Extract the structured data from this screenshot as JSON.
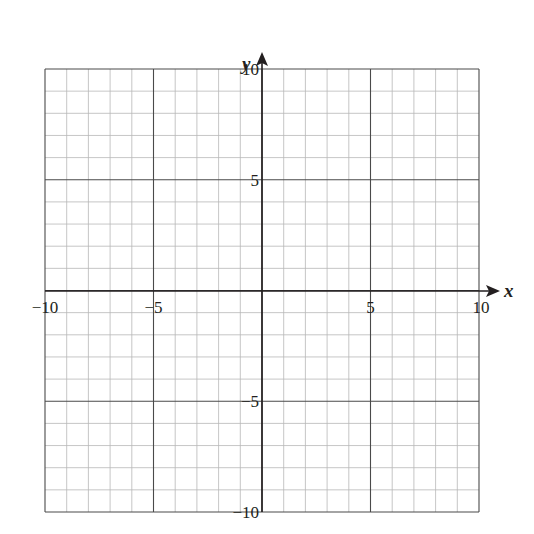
{
  "chart_data": {
    "type": "scatter",
    "title": "",
    "xlabel": "x",
    "ylabel": "y",
    "xlim": [
      -10,
      10
    ],
    "ylim": [
      -10,
      10
    ],
    "grid": true,
    "minor_grid_step": 1,
    "major_grid_step": 5,
    "x_ticks": [
      {
        "value": -10,
        "label": "−10"
      },
      {
        "value": -5,
        "label": "−5"
      },
      {
        "value": 5,
        "label": "5"
      },
      {
        "value": 10,
        "label": "10"
      }
    ],
    "y_ticks": [
      {
        "value": 10,
        "label": "10"
      },
      {
        "value": 5,
        "label": "5"
      },
      {
        "value": -5,
        "label": "−5"
      },
      {
        "value": -10,
        "label": "−10"
      }
    ],
    "series": [],
    "colors": {
      "axis": "#231f20",
      "major_grid": "#4a4a4a",
      "minor_grid": "#b8b8b8"
    }
  }
}
